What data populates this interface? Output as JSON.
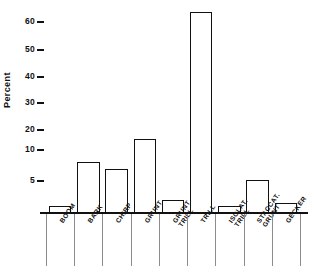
{
  "chart_data": {
    "type": "bar",
    "title": "",
    "xlabel": "",
    "ylabel": "Percent",
    "categories": [
      "BOOM",
      "BARK",
      "CHIRP",
      "GRUNT",
      "GRUNT TRILL",
      "TRILL",
      "ISOLAT. TRILL",
      "STACCAT. GRUNT",
      "GECKER"
    ],
    "category_lines": [
      [
        "BOOM",
        ""
      ],
      [
        "BARK",
        ""
      ],
      [
        "CHIRP",
        ""
      ],
      [
        "GRUNT",
        ""
      ],
      [
        "GRUNT",
        "TRILL"
      ],
      [
        "TRILL",
        ""
      ],
      [
        "ISOLAT.",
        "TRILL"
      ],
      [
        "STACCAT.",
        "GRUNT"
      ],
      [
        "GECKER",
        ""
      ]
    ],
    "values": [
      1,
      8,
      7,
      15.5,
      2,
      63.5,
      1,
      5.2,
      1.5
    ],
    "ytick_labels": [
      "5",
      "10",
      "20",
      "30",
      "40",
      "50",
      "60"
    ],
    "ytick_values": [
      5,
      10,
      20,
      30,
      40,
      50,
      60
    ],
    "ylim": [
      0,
      66
    ],
    "grid": false,
    "legend": "none",
    "axis_color": "#111111",
    "bar_edge_color": "#111111",
    "bar_fill_color": "none"
  }
}
